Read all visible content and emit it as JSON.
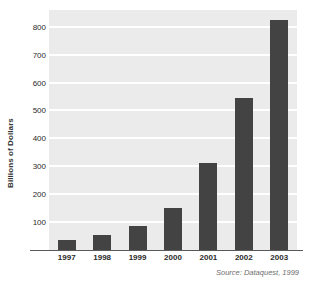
{
  "chart_data": {
    "type": "bar",
    "title": "",
    "xlabel": "",
    "ylabel": "Billions of Dollars",
    "categories": [
      "1997",
      "1998",
      "1999",
      "2000",
      "2001",
      "2002",
      "2003"
    ],
    "values": [
      35,
      55,
      85,
      152,
      313,
      545,
      825
    ],
    "ylim": [
      0,
      860
    ],
    "yticks": [
      100,
      200,
      300,
      400,
      500,
      600,
      700,
      800
    ],
    "ytick_labels": [
      "100",
      "200",
      "300",
      "400",
      "500",
      "600",
      "700",
      "800"
    ],
    "grid": true,
    "legend": null,
    "annotations": [
      "Source: Dataquest, 1999"
    ],
    "colors": {
      "bar": "#434343",
      "plot_background": "#ebebeb",
      "gridline": "#ffffff",
      "axis_line": "#595959",
      "tick_text": "#2b2b2b",
      "source_text": "#6e6e6e"
    }
  },
  "source": {
    "note": "Source: Dataquest, 1999"
  }
}
